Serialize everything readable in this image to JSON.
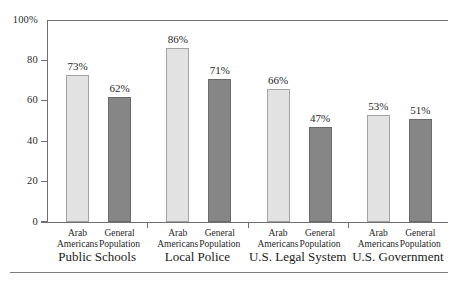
{
  "chart_data": {
    "type": "bar",
    "title": "",
    "xlabel": "",
    "ylabel": "",
    "ylim": [
      0,
      100
    ],
    "yticks": [
      0,
      20,
      40,
      60,
      80,
      100
    ],
    "ytick_labels": [
      "0",
      "20",
      "40",
      "60",
      "80",
      "100%"
    ],
    "grid": false,
    "legend_position": "none",
    "categories": [
      "Public Schools",
      "Local Police",
      "U.S. Legal System",
      "U.S. Government"
    ],
    "series": [
      {
        "name": "Arab Americans",
        "name_line1": "Arab",
        "name_line2": "Americans",
        "color": "#e2e2e2",
        "values": [
          73,
          86,
          66,
          53
        ],
        "value_labels": [
          "73%",
          "86%",
          "66%",
          "53%"
        ]
      },
      {
        "name": "General Population",
        "name_line1": "General",
        "name_line2": "Population",
        "color": "#868686",
        "values": [
          62,
          71,
          47,
          51
        ],
        "value_labels": [
          "62%",
          "71%",
          "47%",
          "51%"
        ]
      }
    ]
  },
  "axis": {
    "tick_0": "0",
    "tick_20": "20",
    "tick_40": "40",
    "tick_60": "60",
    "tick_80": "80",
    "tick_100": "100%"
  },
  "groups": [
    {
      "label": "Public Schools",
      "bars": [
        {
          "series_line1": "Arab",
          "series_line2": "Americans",
          "value_label": "73%"
        },
        {
          "series_line1": "General",
          "series_line2": "Population",
          "value_label": "62%"
        }
      ]
    },
    {
      "label": "Local Police",
      "bars": [
        {
          "series_line1": "Arab",
          "series_line2": "Americans",
          "value_label": "86%"
        },
        {
          "series_line1": "General",
          "series_line2": "Population",
          "value_label": "71%"
        }
      ]
    },
    {
      "label": "U.S. Legal System",
      "bars": [
        {
          "series_line1": "Arab",
          "series_line2": "Americans",
          "value_label": "66%"
        },
        {
          "series_line1": "General",
          "series_line2": "Population",
          "value_label": "47%"
        }
      ]
    },
    {
      "label": "U.S. Government",
      "bars": [
        {
          "series_line1": "Arab",
          "series_line2": "Americans",
          "value_label": "53%"
        },
        {
          "series_line1": "General",
          "series_line2": "Population",
          "value_label": "51%"
        }
      ]
    }
  ]
}
